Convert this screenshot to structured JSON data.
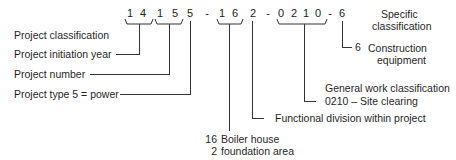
{
  "code": {
    "digits": [
      "1",
      "4",
      "1",
      "5",
      "5",
      "-",
      "1",
      "6",
      "2",
      "-",
      "0",
      "2",
      "1",
      "0",
      "-",
      "6"
    ],
    "full": "1415 5 - 16 2 - 0210 - 6"
  },
  "labels": {
    "project_classification": "Project classification",
    "project_initiation_year": "Project initiation year",
    "project_number": "Project number",
    "project_type": "Project type 5 = power",
    "specific_classification_line1": "Specific",
    "specific_classification_line2": "classification",
    "construction_equipment_code": "6",
    "construction_equipment_line1": "Construction",
    "construction_equipment_line2": "equipment",
    "general_work_line1": "General work classification",
    "general_work_line2": "0210 – Site clearing",
    "functional_division": "Functional division within project",
    "boiler_house_code": "16",
    "boiler_house_label": "Boiler house",
    "foundation_code": "2",
    "foundation_label": "foundation area"
  }
}
